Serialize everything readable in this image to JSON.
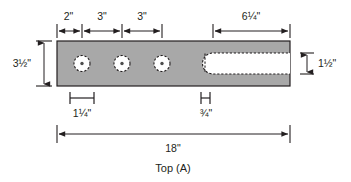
{
  "drawing": {
    "caption": "Top (A)",
    "part": {
      "name": "steel-plate",
      "fill_color": "#a8a8a8",
      "outline_color": "#231f20",
      "overall_length": "18\"",
      "overall_width": "3½\""
    },
    "dimensions": {
      "top": [
        {
          "id": "edge-to-hole1",
          "label": "2\""
        },
        {
          "id": "hole1-to-hole2",
          "label": "3\""
        },
        {
          "id": "hole2-to-hole3",
          "label": "3\""
        },
        {
          "id": "slot-length",
          "label": "6¼\""
        }
      ],
      "left": {
        "id": "plate-width",
        "label": "3½\""
      },
      "right": {
        "id": "slot-width",
        "label": "1½\""
      },
      "bottom_brackets": [
        {
          "id": "hole-diameter",
          "label": "1¼\""
        },
        {
          "id": "slot-end-width",
          "label": "¾\""
        }
      ],
      "bottom_overall": {
        "id": "overall-length",
        "label": "18\""
      }
    },
    "features": {
      "holes": [
        {
          "id": "hole-1"
        },
        {
          "id": "hole-2"
        },
        {
          "id": "hole-3"
        }
      ],
      "slot": {
        "id": "open-slot"
      }
    }
  }
}
